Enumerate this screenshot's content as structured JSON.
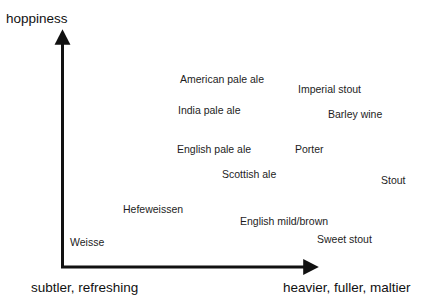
{
  "chart_data": {
    "type": "scatter",
    "title": "",
    "subtitle": "",
    "xlabel": "subtler, refreshing → heavier, fuller, maltier",
    "ylabel": "hoppiness",
    "xlabel_low": "subtler, refreshing",
    "xlabel_high": "heavier, fuller, maltier",
    "axis_labels": {
      "y_top": "hoppiness",
      "x_left": "subtler, refreshing",
      "x_right": "heavier, fuller, maltier"
    },
    "grid": false,
    "legend": "none",
    "axis_style": "arrows",
    "xlim": [
      0,
      100
    ],
    "ylim": [
      0,
      100
    ],
    "note": "Qualitative beer-style map; x = body/maltiness, y = hoppiness. Values estimated from label positions as percentages of the axis span.",
    "points": [
      {
        "label": "American pale ale",
        "x": 48,
        "y": 82,
        "left": 180,
        "top": 73
      },
      {
        "label": "Imperial stout",
        "x": 95,
        "y": 78,
        "left": 298,
        "top": 83
      },
      {
        "label": "India pale ale",
        "x": 46,
        "y": 67,
        "left": 178,
        "top": 104
      },
      {
        "label": "Barley wine",
        "x": 104,
        "y": 65,
        "left": 328,
        "top": 108
      },
      {
        "label": "English pale ale",
        "x": 45,
        "y": 52,
        "left": 177,
        "top": 143
      },
      {
        "label": "Porter",
        "x": 92,
        "y": 52,
        "left": 295,
        "top": 143
      },
      {
        "label": "Scottish ale",
        "x": 63,
        "y": 43,
        "left": 222,
        "top": 168
      },
      {
        "label": "Stout",
        "x": 127,
        "y": 41,
        "left": 381,
        "top": 174
      },
      {
        "label": "Hefeweissen",
        "x": 24,
        "y": 28,
        "left": 123,
        "top": 203
      },
      {
        "label": "English mild/brown",
        "x": 71,
        "y": 23,
        "left": 240,
        "top": 215
      },
      {
        "label": "Sweet stout",
        "x": 101,
        "y": 16,
        "left": 317,
        "top": 233
      },
      {
        "label": "Weisse",
        "x": 3,
        "y": 12,
        "left": 70,
        "top": 236
      }
    ]
  },
  "colors": {
    "axis": "#111111",
    "text": "#1a1a1a",
    "background": "#ffffff"
  }
}
